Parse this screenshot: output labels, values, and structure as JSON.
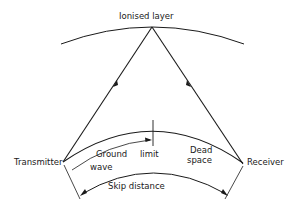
{
  "diagram": {
    "type": "radio-propagation",
    "labels": {
      "ionised_layer": "Ionised layer",
      "transmitter": "Transmitter",
      "receiver": "Receiver",
      "ground_line1": "Ground",
      "ground_line2": "wave",
      "limit": "limit",
      "dead_line1": "Dead",
      "dead_line2": "space",
      "skip_distance": "Skip distance"
    },
    "colors": {
      "stroke": "#1a1a1a",
      "background": "#ffffff"
    }
  }
}
